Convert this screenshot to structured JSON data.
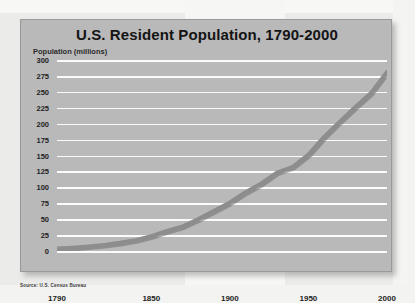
{
  "source_note": "Source: U.S. Census Bureau",
  "colors": {
    "card_background": "#b9b9b9",
    "gridline": "#fbfbfb",
    "line": "#8d8d8d",
    "title_text": "#141414",
    "tick_text": "#232323"
  },
  "chart_data": {
    "type": "line",
    "title": "U.S. Resident Population, 1790-2000",
    "xlabel": "",
    "ylabel": "Population (millions)",
    "xlim": [
      1790,
      2000
    ],
    "ylim": [
      0,
      300
    ],
    "grid": true,
    "legend": "none",
    "xticks": [
      1790,
      1850,
      1900,
      1950,
      2000
    ],
    "xtick_labels": [
      "1790",
      "1850",
      "1900",
      "1950",
      "2000"
    ],
    "yticks": [
      0,
      25,
      50,
      75,
      100,
      125,
      150,
      175,
      200,
      225,
      250,
      275,
      300
    ],
    "ytick_labels": [
      "0",
      "25",
      "50",
      "75",
      "100",
      "125",
      "150",
      "175",
      "200",
      "225",
      "250",
      "275",
      "300"
    ],
    "series": [
      {
        "name": "U.S. Resident Population",
        "x": [
          1790,
          1800,
          1810,
          1820,
          1830,
          1840,
          1850,
          1860,
          1870,
          1880,
          1890,
          1900,
          1910,
          1920,
          1930,
          1940,
          1950,
          1960,
          1970,
          1980,
          1990,
          2000
        ],
        "values": [
          3.9,
          5.3,
          7.2,
          9.6,
          12.9,
          17.1,
          23.2,
          31.4,
          38.6,
          50.2,
          63.0,
          76.2,
          92.2,
          106.0,
          123.2,
          132.2,
          151.3,
          179.3,
          203.3,
          226.5,
          248.7,
          281.4
        ]
      }
    ]
  }
}
